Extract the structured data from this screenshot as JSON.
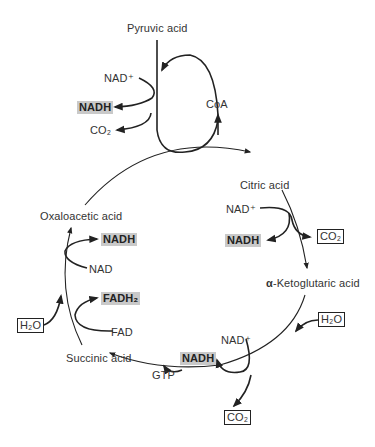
{
  "diagram": {
    "type": "citric-acid-cycle",
    "nodes": {
      "pyruvic_acid": "Pyruvic acid",
      "coa": "CoA",
      "citric_acid": "Citric acid",
      "alpha_ketoglutaric_acid_prefix": "α",
      "alpha_ketoglutaric_acid": "-Ketoglutaric acid",
      "succinic_acid": "Succinic acid",
      "oxaloacetic_acid": "Oxaloacetic acid"
    },
    "pyruvate_step": {
      "input": "NAD⁺",
      "output_nadh": "NADH",
      "output_co2": "CO₂"
    },
    "citrate_step": {
      "input": "NAD⁺",
      "output_nadh": "NADH",
      "output_co2": "CO₂"
    },
    "ketoglutarate_step": {
      "h2o": "H₂O",
      "input": "NAD⁺",
      "output_nadh": "NADH",
      "output_gtp": "GTP",
      "output_co2": "CO₂"
    },
    "succinate_step": {
      "h2o": "H₂O",
      "fad_input": "FAD",
      "fad_output": "FADH₂",
      "nad_input": "NAD",
      "nad_output": "NADH"
    },
    "colors": {
      "line": "#222222",
      "highlight": "#c9c9c9",
      "text": "#333333"
    }
  }
}
